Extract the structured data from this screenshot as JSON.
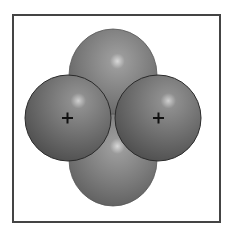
{
  "diagram": {
    "title": "",
    "nuclei": [
      {
        "label": "+",
        "cx": 68,
        "cy": 118
      },
      {
        "label": "+",
        "cx": 158,
        "cy": 118
      }
    ],
    "lobes": [
      {
        "position": "top",
        "cx": 113,
        "cy": 72
      },
      {
        "position": "bottom",
        "cx": 113,
        "cy": 163
      }
    ],
    "colors": {
      "sphere": "#6e6e6e",
      "lobe": "#7a7a7a",
      "highlight": "#d8d8d8",
      "outline": "#2a2a2a",
      "frame": "#444444"
    }
  }
}
